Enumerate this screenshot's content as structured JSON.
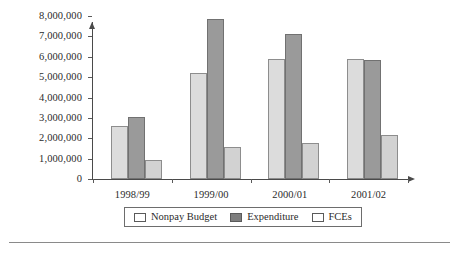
{
  "chart_data": {
    "type": "bar",
    "title": "",
    "xlabel": "",
    "ylabel": "",
    "categories": [
      "1998/99",
      "1999/00",
      "2000/01",
      "2001/02"
    ],
    "series": [
      {
        "name": "Nonpay Budget",
        "color": "#dcdcdc",
        "values": [
          2600000,
          5200000,
          5900000,
          5900000
        ]
      },
      {
        "name": "Expenditure",
        "color": "#9a9a9a",
        "values": [
          3050000,
          7850000,
          7100000,
          5850000
        ]
      },
      {
        "name": "FCEs",
        "color": "#d2d2d2",
        "values": [
          920000,
          1580000,
          1780000,
          2150000
        ]
      }
    ],
    "ylim": [
      0,
      8000000
    ],
    "ytick_values": [
      0,
      1000000,
      2000000,
      3000000,
      4000000,
      5000000,
      6000000,
      7000000,
      8000000
    ],
    "ytick_labels": [
      "0",
      "1,000,000",
      "2,000,000",
      "3,000,000",
      "4,000,000",
      "5,000,000",
      "6,000,000",
      "7,000,000",
      "8,000,000"
    ],
    "grid": false,
    "legend_position": "bottom",
    "axis_arrows": true
  },
  "legend": {
    "items": [
      {
        "label": "Nonpay Budget",
        "swatch": "legend-swatch-nonpay-budget"
      },
      {
        "label": "Expenditure",
        "swatch": "legend-swatch-expenditure"
      },
      {
        "label": "FCEs",
        "swatch": "legend-swatch-fces"
      }
    ]
  }
}
